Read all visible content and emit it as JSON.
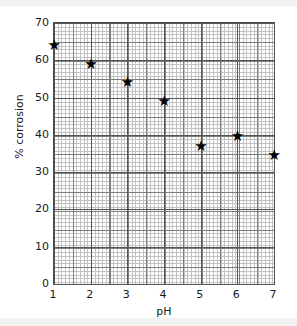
{
  "chart_data": {
    "type": "scatter",
    "title": "",
    "xlabel": "pH",
    "ylabel": "% corrosion",
    "xlim": [
      1,
      7
    ],
    "ylim": [
      0,
      70
    ],
    "xticks": [
      1,
      2,
      3,
      4,
      5,
      6,
      7
    ],
    "yticks": [
      0,
      10,
      20,
      30,
      40,
      50,
      60,
      70
    ],
    "xtick_labels": [
      "1",
      "2",
      "3",
      "4",
      "5",
      "6",
      "7"
    ],
    "ytick_labels": [
      "0",
      "10",
      "20",
      "30",
      "40",
      "50",
      "60",
      "70"
    ],
    "grid": true,
    "grid_style": "graph-paper-fine",
    "legend": "none",
    "marker": "star",
    "marker_glyph": "★",
    "marker_color": "#000000",
    "x": [
      1,
      2,
      3,
      4,
      5,
      6,
      7
    ],
    "values": [
      64,
      59,
      54,
      49,
      37,
      39.5,
      34.5
    ],
    "points": [
      {
        "x": 1,
        "y": 64
      },
      {
        "x": 2,
        "y": 59
      },
      {
        "x": 3,
        "y": 54
      },
      {
        "x": 4,
        "y": 49
      },
      {
        "x": 5,
        "y": 37
      },
      {
        "x": 6,
        "y": 39.5
      },
      {
        "x": 7,
        "y": 34.5
      }
    ]
  }
}
